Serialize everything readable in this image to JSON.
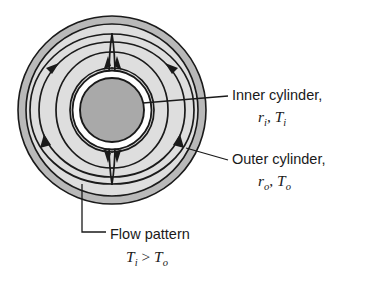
{
  "figure": {
    "type": "annulus-natural-convection-diagram",
    "geometry": {
      "center": [
        112,
        110
      ],
      "outer_wall_outer_radius": 94,
      "outer_wall_inner_radius": 86,
      "inner_cylinder_radius": 32,
      "inner_cylinder_white_ring_radius": 40
    },
    "colors": {
      "outer_wall_band": "#b9b9b9",
      "annulus_fill": "#dedede",
      "inner_cylinder_fill": "#a9a9a9",
      "stroke": "#1a1a1a",
      "background": "#ffffff",
      "ring_gap": "#ffffff"
    },
    "labels": {
      "inner_cylinder": {
        "text": "Inner cylinder,",
        "symbols": {
          "radius": "r",
          "radius_sub": "i",
          "temp": "T",
          "temp_sub": "i",
          "separator": ", "
        }
      },
      "outer_cylinder": {
        "text": "Outer cylinder,",
        "symbols": {
          "radius": "r",
          "radius_sub": "o",
          "temp": "T",
          "temp_sub": "o",
          "separator": ", "
        }
      },
      "flow_pattern": {
        "text": "Flow pattern",
        "condition": {
          "left": "T",
          "left_sub": "i",
          "relation": " > ",
          "right": "T",
          "right_sub": "o"
        }
      }
    },
    "flow": {
      "cells": 2,
      "left_cell_direction": "clockwise-descending-on-outer-wall",
      "right_cell_direction": "counterclockwise-descending-on-outer-wall",
      "convergence_top": "upward",
      "convergence_bottom": "downward",
      "streamlines_per_cell": 3,
      "arrowhead_count": 8
    }
  }
}
